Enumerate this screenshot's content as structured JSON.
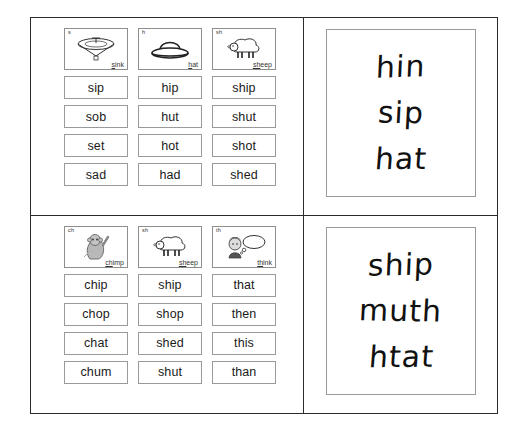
{
  "worksheet": {
    "title": "Phonics word card worksheet",
    "quadrants": [
      {
        "id": "top-left",
        "picture_cards": [
          {
            "letter": "s",
            "word": "sink",
            "onset": "s",
            "rest": "ink",
            "art": "sink-icon"
          },
          {
            "letter": "h",
            "word": "hat",
            "onset": "h",
            "rest": "at",
            "art": "hat-icon"
          },
          {
            "letter": "sh",
            "word": "sheep",
            "onset": "sh",
            "rest": "eep",
            "art": "sheep-icon"
          }
        ],
        "word_rows": [
          [
            "sip",
            "hip",
            "ship"
          ],
          [
            "sob",
            "hut",
            "shut"
          ],
          [
            "set",
            "hot",
            "shot"
          ],
          [
            "sad",
            "had",
            "shed"
          ]
        ]
      },
      {
        "id": "bottom-left",
        "picture_cards": [
          {
            "letter": "ch",
            "word": "chimp",
            "onset": "ch",
            "rest": "imp",
            "art": "chimp-icon"
          },
          {
            "letter": "sh",
            "word": "sheep",
            "onset": "sh",
            "rest": "eep",
            "art": "sheep-icon"
          },
          {
            "letter": "th",
            "word": "think",
            "onset": "th",
            "rest": "ink",
            "art": "think-icon"
          }
        ],
        "word_rows": [
          [
            "chip",
            "ship",
            "that"
          ],
          [
            "chop",
            "shop",
            "then"
          ],
          [
            "chat",
            "shed",
            "this"
          ],
          [
            "chum",
            "shut",
            "than"
          ]
        ]
      }
    ],
    "handwriting": [
      {
        "id": "top-right",
        "lines": [
          "hin",
          "sip",
          "hat"
        ]
      },
      {
        "id": "bottom-right",
        "lines": [
          "ship",
          "muth",
          "htat"
        ]
      }
    ]
  },
  "colors": {
    "frame": "#2b2b2b",
    "card_border": "#9a9a9a",
    "text": "#1a1a1a",
    "handwriting": "#111111",
    "background": "#ffffff"
  }
}
